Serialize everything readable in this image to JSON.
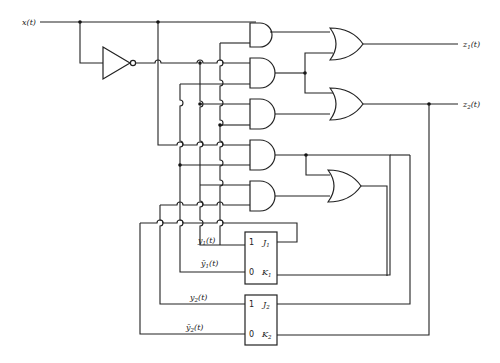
{
  "diagram": {
    "type": "sequential-logic-circuit",
    "inputs": [
      {
        "name": "x",
        "label": "x(t)"
      }
    ],
    "outputs": [
      {
        "name": "z1",
        "label": "z",
        "sub": "1",
        "suffix": "(t)"
      },
      {
        "name": "z2",
        "label": "z",
        "sub": "2",
        "suffix": "(t)"
      }
    ],
    "gates": {
      "inverter": {
        "count": 1
      },
      "and": {
        "count": 5
      },
      "or": {
        "count": 3
      }
    },
    "flip_flops": [
      {
        "name": "FF1",
        "pins": {
          "q1": "1",
          "q0": "0",
          "j": "J",
          "j_sub": "1",
          "k": "K",
          "k_sub": "1"
        },
        "q_label": "y",
        "q_sub": "1",
        "q_suffix": "(t)",
        "qbar_label": "ȳ",
        "qbar_sub": "1",
        "qbar_suffix": "(t)"
      },
      {
        "name": "FF2",
        "pins": {
          "q1": "1",
          "q0": "0",
          "j": "J",
          "j_sub": "2",
          "k": "K",
          "k_sub": "2"
        },
        "q_label": "y",
        "q_sub": "2",
        "q_suffix": "(t)",
        "qbar_label": "ȳ",
        "qbar_sub": "2",
        "qbar_suffix": "(t)"
      }
    ],
    "colors": {
      "line": "#222222",
      "background": "#ffffff"
    }
  }
}
